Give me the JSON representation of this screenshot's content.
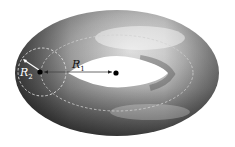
{
  "diagram": {
    "shape": "torus",
    "labels": {
      "major_radius": {
        "symbol": "R",
        "subscript": "1"
      },
      "minor_radius": {
        "symbol": "R",
        "subscript": "2"
      }
    },
    "colors": {
      "background": "#ffffff",
      "torus_light": "#e8e8e8",
      "torus_mid": "#8a8a8a",
      "torus_dark": "#2e2e2e",
      "dashed_lines": "#cfcfcf",
      "center_dot": "#000000"
    },
    "elements": [
      "torus-surface",
      "center-circle-dashed",
      "cross-section-circle-dashed",
      "major-radius-arrow",
      "minor-radius-arrow",
      "center-point",
      "tube-center-point"
    ]
  }
}
